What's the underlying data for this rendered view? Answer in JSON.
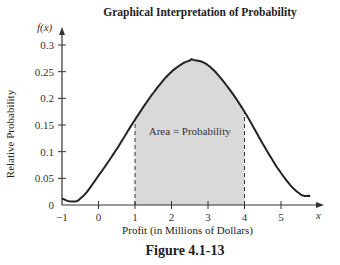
{
  "chart_data": {
    "type": "area",
    "title": "Graphical Interpretation of Probability",
    "xlabel": "Profit (in Millions of Dollars)",
    "ylabel": "Relative Probability",
    "y_axis_symbol": "f(x)",
    "x_axis_symbol": "x",
    "xlim": [
      -1,
      5.9
    ],
    "ylim": [
      0,
      0.3
    ],
    "x_ticks": [
      "-1",
      "0",
      "1",
      "2",
      "3",
      "4",
      "5"
    ],
    "y_ticks": [
      "0",
      "0.05",
      "0.1",
      "0.15",
      "0.2",
      "0.25",
      "0.3"
    ],
    "grid": false,
    "curve": {
      "x": [
        -1,
        -0.8,
        -0.5,
        0,
        0.5,
        1,
        1.5,
        2,
        2.5,
        2.6,
        3,
        3.5,
        4,
        4.5,
        5,
        5.5,
        5.8
      ],
      "y": [
        0.012,
        0.007,
        0.012,
        0.055,
        0.105,
        0.16,
        0.21,
        0.25,
        0.271,
        0.272,
        0.262,
        0.225,
        0.175,
        0.115,
        0.06,
        0.022,
        0.017
      ]
    },
    "shaded_region": {
      "from": 1,
      "to": 4,
      "label": "Area = Probability",
      "color": "#d9d9d9"
    },
    "annotations": [
      "Area = Probability"
    ]
  },
  "figure_caption": "Figure 4.1-13"
}
